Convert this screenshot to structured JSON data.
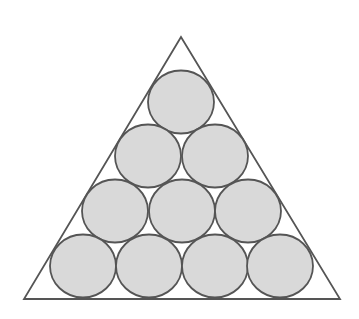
{
  "diagram": {
    "colors": {
      "background": "#ffffff",
      "stroke": "#555555",
      "circle_fill": "#d9d9d9"
    },
    "triangle": {
      "points": "181,37 24,299 340,299"
    },
    "circle_rx": 33,
    "circle_ry": 31.5,
    "rows": [
      {
        "cy": 102,
        "cx": [
          181
        ]
      },
      {
        "cy": 156,
        "cx": [
          148,
          215
        ]
      },
      {
        "cy": 211,
        "cx": [
          115,
          182,
          248
        ]
      },
      {
        "cy": 266,
        "cx": [
          83,
          149,
          215,
          280
        ]
      }
    ]
  }
}
